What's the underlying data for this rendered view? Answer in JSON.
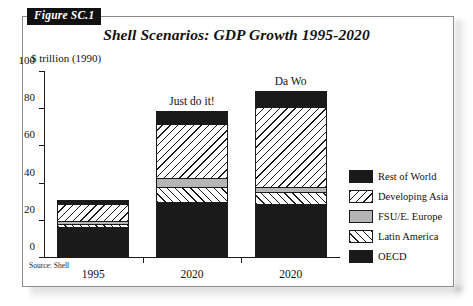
{
  "figure": {
    "tab_label": "Figure SC.1",
    "title": "Shell Scenarios: GDP Growth 1995-2020",
    "source_note": "Source: Shell"
  },
  "chart_data": {
    "type": "bar",
    "title": "Shell Scenarios: GDP Growth 1995-2020",
    "subtitle": "",
    "xlabel": "",
    "ylabel": "$ trillion (1990)",
    "ylim": [
      0,
      100
    ],
    "yticks": [
      0,
      20,
      40,
      60,
      80,
      100
    ],
    "ytick_labels": [
      "0",
      "20",
      "40",
      "60",
      "80",
      "100"
    ],
    "grid": false,
    "stacked": true,
    "legend_position": "right",
    "categories": [
      "1995",
      "2020",
      "2020"
    ],
    "bar_annotations": [
      "",
      "Just do it!",
      "Da Wo"
    ],
    "series": [
      {
        "name": "OECD",
        "fill": "solid-black",
        "color": "#1a1a1a",
        "values": [
          16.5,
          30.0,
          29.0
        ]
      },
      {
        "name": "Latin America",
        "fill": "hatch-forward-slash",
        "color": "#ffffff",
        "values": [
          2.0,
          8.0,
          6.5
        ]
      },
      {
        "name": "FSU/E. Europe",
        "fill": "solid-gray",
        "color": "#b5b5b5",
        "values": [
          1.5,
          5.0,
          2.5
        ]
      },
      {
        "name": "Developing Asia",
        "fill": "hatch-backslash",
        "color": "#ffffff",
        "values": [
          9.0,
          29.0,
          43.0
        ]
      },
      {
        "name": "Rest of World",
        "fill": "solid-black",
        "color": "#1a1a1a",
        "values": [
          2.0,
          7.0,
          9.0
        ]
      }
    ],
    "totals": [
      31,
      79,
      90
    ],
    "legend": [
      {
        "label": "Rest of World",
        "fill": "solid-black",
        "color": "#1a1a1a"
      },
      {
        "label": "Developing Asia",
        "fill": "hatch-backslash",
        "color": "#ffffff"
      },
      {
        "label": "FSU/E. Europe",
        "fill": "solid-gray",
        "color": "#b5b5b5"
      },
      {
        "label": "Latin America",
        "fill": "hatch-forward-slash",
        "color": "#ffffff"
      },
      {
        "label": "OECD",
        "fill": "solid-black",
        "color": "#1a1a1a"
      }
    ]
  }
}
